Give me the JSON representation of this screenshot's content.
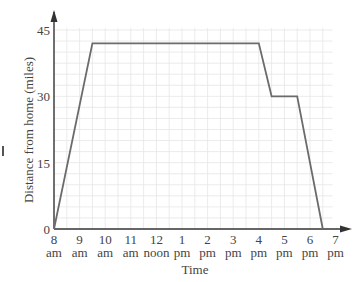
{
  "chart_data": {
    "type": "line",
    "title": "",
    "xlabel": "Time",
    "ylabel": "Distance from home (miles)",
    "x_ticks": [
      {
        "top": "8",
        "bottom": "am"
      },
      {
        "top": "9",
        "bottom": "am"
      },
      {
        "top": "10",
        "bottom": "am"
      },
      {
        "top": "11",
        "bottom": "am"
      },
      {
        "top": "12",
        "bottom": "noon"
      },
      {
        "top": "1",
        "bottom": "pm"
      },
      {
        "top": "2",
        "bottom": "pm"
      },
      {
        "top": "3",
        "bottom": "pm"
      },
      {
        "top": "4",
        "bottom": "pm"
      },
      {
        "top": "5",
        "bottom": "pm"
      },
      {
        "top": "6",
        "bottom": "pm"
      },
      {
        "top": "7",
        "bottom": "pm"
      }
    ],
    "y_ticks": [
      0,
      15,
      30,
      45
    ],
    "xlim_hours": [
      8,
      19
    ],
    "ylim": [
      0,
      45
    ],
    "grid": true,
    "legend": null,
    "series": [
      {
        "name": "Distance from home",
        "color": "#6b6b6b",
        "points": [
          {
            "time": "8:00 am",
            "hour": 8.0,
            "miles": 0
          },
          {
            "time": "9:30 am",
            "hour": 9.5,
            "miles": 42
          },
          {
            "time": "4:00 pm",
            "hour": 16.0,
            "miles": 42
          },
          {
            "time": "4:30 pm",
            "hour": 16.5,
            "miles": 30
          },
          {
            "time": "5:30 pm",
            "hour": 17.5,
            "miles": 30
          },
          {
            "time": "6:30 pm",
            "hour": 18.5,
            "miles": 0
          }
        ]
      }
    ]
  },
  "colors": {
    "axis": "#333333",
    "grid": "#e6e6e6",
    "line": "#6b6b6b"
  }
}
